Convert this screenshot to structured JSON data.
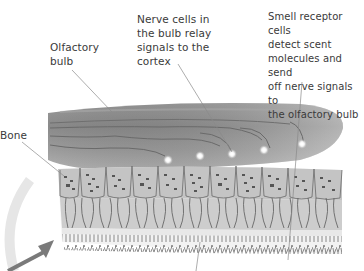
{
  "labels": {
    "olfactory_bulb": "Olfactory\nbulb",
    "nerve_cells": "Nerve cells in\nthe bulb relay\nsignals to the\ncortex",
    "receptor_cells": "Smell receptor cells\ndetect scent\nmolecules and send\noff nerve signals to\nthe olfactory bulb",
    "bone": "Bone"
  },
  "colors": {
    "bulb_fill": "#8c8c8c",
    "bulb_highlight": "#b4b4b4",
    "bone_fill": "#c8c8c8",
    "cell_outline": "#6a6a6a",
    "fiber": "#555555",
    "arrow": "#7a7a7a",
    "leader_line": "#8a8a8a",
    "text": "#3a3a3a"
  },
  "icons": {
    "arrow": "arrow-up-right-icon"
  }
}
